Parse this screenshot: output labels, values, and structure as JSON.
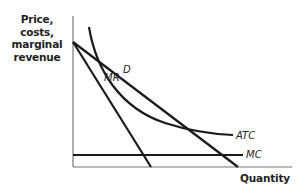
{
  "diagram": {
    "type": "economics-cost-curves",
    "y_axis_label": "Price, costs, marginal revenue",
    "y_axis_lines": [
      "Price, costs,",
      "marginal",
      "revenue"
    ],
    "x_axis_label": "Quantity",
    "curves": {
      "D": "D",
      "MR": "MR",
      "ATC": "ATC",
      "MC": "MC"
    },
    "colors": {
      "line": "#1a1a1a",
      "axis": "#777777",
      "text": "#222222"
    }
  }
}
